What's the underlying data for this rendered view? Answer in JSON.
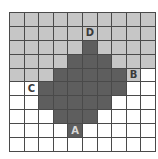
{
  "figure": {
    "type": "grid-diagram",
    "rows": 10,
    "cols": 10,
    "colors": {
      "light_region": "#c6c6c6",
      "dark_region": "#5e5e5e",
      "blank_region": "#ffffff",
      "grid_line": "#4a4a4a",
      "label_text": "#3a3a3a",
      "label_text_on_dark": "#d8d8d8"
    },
    "legend_codes": {
      "g": "light gray cell",
      "d": "dark gray cell",
      "w": "white cell"
    },
    "cells": [
      [
        "g",
        "g",
        "g",
        "g",
        "g",
        "g",
        "g",
        "g",
        "g",
        "g"
      ],
      [
        "g",
        "g",
        "g",
        "g",
        "g",
        "g",
        "g",
        "g",
        "g",
        "g"
      ],
      [
        "g",
        "g",
        "g",
        "g",
        "g",
        "d",
        "g",
        "g",
        "g",
        "g"
      ],
      [
        "g",
        "g",
        "g",
        "g",
        "d",
        "d",
        "d",
        "g",
        "g",
        "g"
      ],
      [
        "g",
        "g",
        "g",
        "d",
        "d",
        "d",
        "d",
        "d",
        "g",
        "w"
      ],
      [
        "w",
        "w",
        "d",
        "d",
        "d",
        "d",
        "d",
        "d",
        "w",
        "w"
      ],
      [
        "w",
        "w",
        "d",
        "d",
        "d",
        "d",
        "d",
        "w",
        "w",
        "w"
      ],
      [
        "w",
        "w",
        "w",
        "d",
        "d",
        "d",
        "w",
        "w",
        "w",
        "w"
      ],
      [
        "w",
        "w",
        "w",
        "w",
        "d",
        "w",
        "w",
        "w",
        "w",
        "w"
      ],
      [
        "w",
        "w",
        "w",
        "w",
        "w",
        "w",
        "w",
        "w",
        "w",
        "w"
      ]
    ],
    "labels": [
      {
        "text": "D",
        "row": 1,
        "col": 5
      },
      {
        "text": "B",
        "row": 4,
        "col": 8
      },
      {
        "text": "C",
        "row": 5,
        "col": 1
      },
      {
        "text": "A",
        "row": 8,
        "col": 4
      }
    ]
  }
}
